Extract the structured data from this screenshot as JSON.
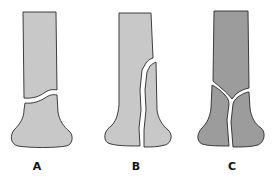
{
  "figure": {
    "panels": [
      {
        "id": "A",
        "label": "A",
        "fracture": "transverse-metaphyseal",
        "fill": "#c8c8c8"
      },
      {
        "id": "B",
        "label": "B",
        "fracture": "oblique-intra-articular",
        "fill": "#c8c8c8"
      },
      {
        "id": "C",
        "label": "C",
        "fracture": "T-shaped-intra-articular",
        "fill": "#9c9c9c"
      }
    ],
    "colors": {
      "outline": "#2a2a2a",
      "light_bone": "#c8c8c8",
      "dark_bone": "#9c9c9c",
      "background": "#ffffff",
      "label": "#111111"
    }
  }
}
